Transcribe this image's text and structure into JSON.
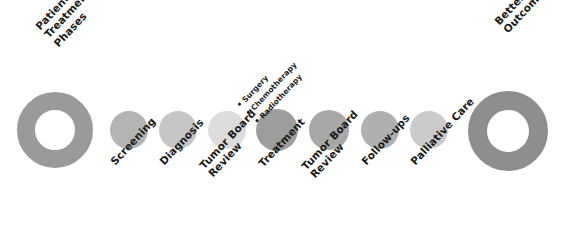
{
  "diagram": {
    "title": "Patient Treatment Phases",
    "background_color": "#ffffff",
    "text_color": "#1a1a1a"
  },
  "start_node": {
    "name": "start-donut",
    "shape": "donut",
    "label_lines": [
      "Patient",
      "Treatment",
      "Phases"
    ],
    "ring_color": "#9a9a9a",
    "hole_color": "#ffffff",
    "outer_diameter": 76,
    "ring_thickness": 18,
    "center_x": 55,
    "center_y": 130
  },
  "end_node": {
    "name": "end-donut",
    "shape": "donut",
    "label_lines": [
      "Better Patient",
      "Outcome"
    ],
    "ring_color": "#8e8e8e",
    "hole_color": "#ffffff",
    "outer_diameter": 80,
    "ring_thickness": 19,
    "center_x": 508,
    "center_y": 131
  },
  "phases": [
    {
      "id": "screening",
      "label_lines": [
        "Screening"
      ],
      "color": "#b4b4b4",
      "diameter": 38,
      "center_x": 129,
      "center_y": 130
    },
    {
      "id": "diagnosis",
      "label_lines": [
        "Diagnosis"
      ],
      "color": "#c6c6c6",
      "diameter": 38,
      "center_x": 178,
      "center_y": 130
    },
    {
      "id": "tumor-board-review-1",
      "label_lines": [
        "Tumor Board",
        "Review"
      ],
      "color": "#dcdcdc",
      "diameter": 38,
      "center_x": 227,
      "center_y": 130
    },
    {
      "id": "treatment",
      "label_lines": [
        "Treatment"
      ],
      "color": "#9d9d9d",
      "diameter": 42,
      "center_x": 277,
      "center_y": 130,
      "sub_items": [
        "Surgery",
        "Chemotherapy",
        "Radiotherapy"
      ]
    },
    {
      "id": "tumor-board-review-2",
      "label_lines": [
        "Tumor Board",
        "Review"
      ],
      "color": "#a8a8a8",
      "diameter": 40,
      "center_x": 329,
      "center_y": 130
    },
    {
      "id": "follow-ups",
      "label_lines": [
        "Follow-ups"
      ],
      "color": "#b0b0b0",
      "diameter": 38,
      "center_x": 380,
      "center_y": 130
    },
    {
      "id": "palliative-care",
      "label_lines": [
        "Palliative Care"
      ],
      "color": "#cbcbcb",
      "diameter": 38,
      "center_x": 429,
      "center_y": 130
    }
  ]
}
